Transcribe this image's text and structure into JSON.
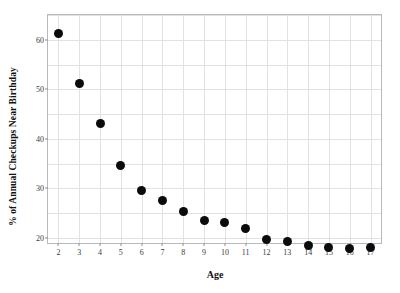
{
  "chart_data": {
    "type": "scatter",
    "title": "",
    "xlabel": "Age",
    "ylabel": "% of Annual Checkups Near Birthday",
    "x": [
      2,
      3,
      4,
      5,
      6,
      7,
      8,
      9,
      10,
      11,
      12,
      13,
      14,
      15,
      16,
      17
    ],
    "values": [
      61.2,
      51.1,
      43.2,
      34.6,
      29.5,
      27.6,
      25.3,
      23.6,
      23.1,
      22.0,
      19.7,
      19.3,
      18.4,
      18.0,
      17.8,
      18.1
    ],
    "categories": [
      "2",
      "3",
      "4",
      "5",
      "6",
      "7",
      "8",
      "9",
      "10",
      "11",
      "12",
      "13",
      "14",
      "15",
      "16",
      "17"
    ],
    "xtick_labels": [
      "2",
      "3",
      "4",
      "5",
      "6",
      "7",
      "8",
      "9",
      "10",
      "11",
      "12",
      "13",
      "14",
      "15",
      "16",
      "17"
    ],
    "ytick_labels": [
      "20",
      "30",
      "40",
      "50",
      "60"
    ],
    "ytick_values": [
      20,
      30,
      40,
      50,
      60
    ],
    "ygrid_values": [
      20,
      25,
      30,
      35,
      40,
      45,
      50,
      55,
      60,
      65
    ],
    "ylim": [
      19,
      65
    ],
    "xlim": [
      1.5,
      17.5
    ],
    "grid": true,
    "legend": "none",
    "marker_color": "#0b0b0b",
    "grid_color": "#e2e2e6",
    "frame_color": "#b9b9bd",
    "background_color": "#ffffff"
  }
}
